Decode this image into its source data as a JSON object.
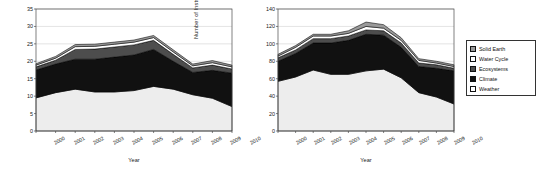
{
  "figure": {
    "background": "#ffffff",
    "panel_count": 2
  },
  "legend": {
    "position": "right-outside",
    "border_color": "#333333",
    "items": [
      {
        "label": "Solid Earth",
        "color": "#999999",
        "pattern": "gray"
      },
      {
        "label": "Water Cycle",
        "color": "#ffffff",
        "pattern": "white"
      },
      {
        "label": "Ecosystems",
        "color": "#4d4d4d",
        "pattern": "dark-gray"
      },
      {
        "label": "Climate",
        "color": "#111111",
        "pattern": "black"
      },
      {
        "label": "Weather",
        "color": "#ffffff",
        "pattern": "white"
      }
    ]
  },
  "chart_data": [
    {
      "type": "area",
      "id": "missions",
      "title": "",
      "xlabel": "Year",
      "ylabel": "Number of Missions",
      "x": [
        2000,
        2001,
        2002,
        2003,
        2004,
        2005,
        2006,
        2007,
        2008,
        2009,
        2010
      ],
      "xticklabels": [
        "2000",
        "2001",
        "2002",
        "2003",
        "2004",
        "2005",
        "2006",
        "2007",
        "2008",
        "2009",
        "2010"
      ],
      "yticks": [
        0,
        5,
        10,
        15,
        20,
        25,
        30,
        35
      ],
      "ylim": [
        0,
        35
      ],
      "xlim": [
        2000,
        2010
      ],
      "grid": true,
      "stacked": true,
      "series": [
        {
          "name": "Weather",
          "color": "#ededed",
          "values": [
            9.5,
            11.0,
            12.0,
            11.2,
            11.2,
            11.6,
            12.8,
            12.0,
            10.4,
            9.4,
            7.0
          ]
        },
        {
          "name": "Climate",
          "color": "#111111",
          "values": [
            8.0,
            8.2,
            8.6,
            9.4,
            10.0,
            10.2,
            10.6,
            8.0,
            6.4,
            8.0,
            9.6
          ]
        },
        {
          "name": "Ecosystems",
          "color": "#4d4d4d",
          "values": [
            0.9,
            1.1,
            2.8,
            2.9,
            2.9,
            2.9,
            2.6,
            2.0,
            1.3,
            1.5,
            1.2
          ]
        },
        {
          "name": "Water Cycle",
          "color": "#ffffff",
          "values": [
            0.5,
            0.6,
            0.8,
            0.8,
            0.8,
            0.8,
            0.8,
            0.7,
            0.6,
            0.7,
            0.6
          ]
        },
        {
          "name": "Solid Earth",
          "color": "#9a9a9a",
          "values": [
            0.4,
            0.5,
            0.6,
            0.6,
            0.6,
            0.6,
            0.6,
            0.6,
            0.5,
            0.6,
            0.5
          ]
        }
      ],
      "totals": [
        19.3,
        21.4,
        24.8,
        24.9,
        25.5,
        26.1,
        27.4,
        23.3,
        19.2,
        20.2,
        18.9
      ]
    },
    {
      "type": "area",
      "id": "instruments",
      "title": "",
      "xlabel": "Year",
      "ylabel": "Number of Instruments",
      "x": [
        2000,
        2001,
        2002,
        2003,
        2004,
        2005,
        2006,
        2007,
        2008,
        2009,
        2010
      ],
      "xticklabels": [
        "2000",
        "2001",
        "2002",
        "2003",
        "2004",
        "2005",
        "2006",
        "2007",
        "2008",
        "2009",
        "2010"
      ],
      "yticks": [
        0,
        20,
        40,
        60,
        80,
        100,
        120,
        140
      ],
      "ylim": [
        0,
        140
      ],
      "xlim": [
        2000,
        2010
      ],
      "grid": true,
      "stacked": true,
      "series": [
        {
          "name": "Weather",
          "color": "#ededed",
          "values": [
            57,
            62,
            70,
            65,
            65,
            69,
            71,
            61,
            44,
            39,
            31
          ]
        },
        {
          "name": "Climate",
          "color": "#111111",
          "values": [
            23,
            27,
            31,
            36,
            39,
            42,
            39,
            35,
            30,
            33,
            38
          ]
        },
        {
          "name": "Ecosystems",
          "color": "#4d4d4d",
          "values": [
            4,
            4,
            5,
            5,
            5,
            5,
            5,
            5,
            4,
            4,
            3
          ]
        },
        {
          "name": "Water Cycle",
          "color": "#ffffff",
          "values": [
            2,
            3,
            3,
            3,
            3,
            4,
            3,
            3,
            3,
            2,
            2
          ]
        },
        {
          "name": "Solid Earth",
          "color": "#9a9a9a",
          "values": [
            2,
            2,
            2,
            2,
            3,
            5,
            4,
            3,
            2,
            2,
            2
          ]
        }
      ],
      "totals": [
        88,
        98,
        111,
        111,
        115,
        125,
        122,
        107,
        83,
        80,
        76
      ]
    }
  ]
}
